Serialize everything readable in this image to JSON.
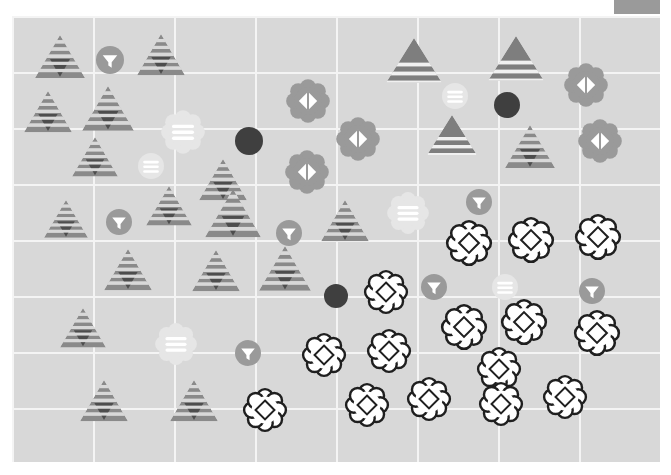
{
  "app": {
    "title": "Scatter Plot Canvas",
    "background_color": "#ffffff"
  },
  "corner_tab": {
    "name": "legend-swatch",
    "color": "#9a9a9a",
    "x": 614,
    "y": 0,
    "width": 46,
    "height": 14
  },
  "canvas": {
    "x": 12,
    "y": 16,
    "width": 648,
    "height": 446,
    "background_color": "#d8d8d8",
    "grid": {
      "visible": true,
      "color": "#f4f4f4",
      "vertical_x": [
        12,
        93,
        174,
        255,
        336,
        417,
        498,
        579,
        660
      ],
      "horizontal_y": [
        16,
        72,
        128,
        184,
        240,
        296,
        352,
        408,
        462
      ]
    }
  },
  "palette": {
    "triangle_gray": "#8a8a8a",
    "triangle_dark": "#4d4d4d",
    "triangle_stripe": "#d8d8d8",
    "circle_gray": "#9a9a9a",
    "circle_dark": "#3f3f3f",
    "flower_gray": "#9a9a9a",
    "flower_white_fill": "#ffffff",
    "flower_white_stroke": "#1f1f1f",
    "faded": "#e6e6e6",
    "faded_inner": "#fbfbfb"
  },
  "chart_data": {
    "type": "scatter",
    "title": "",
    "xlabel": "",
    "ylabel": "",
    "xlim": [
      0,
      671
    ],
    "ylim": [
      0,
      475
    ],
    "grid": true,
    "legend": "none",
    "glyph_classes": [
      {
        "id": "striped-triangle",
        "shape": "triangle",
        "fill": "#8a8a8a",
        "pattern": "horizontal-stripes",
        "inner": "down-triangle-dark"
      },
      {
        "id": "banded-triangle",
        "shape": "triangle",
        "fill": "#8a8a8a",
        "pattern": "wide-bands",
        "inner": "none"
      },
      {
        "id": "funnel-circle",
        "shape": "circle",
        "fill": "#9a9a9a",
        "inner": "white-funnel"
      },
      {
        "id": "solid-dark-circle",
        "shape": "circle",
        "fill": "#3f3f3f",
        "inner": "none"
      },
      {
        "id": "faded-striped-circle",
        "shape": "circle",
        "fill": "#e6e6e6",
        "inner": "white-stripes"
      },
      {
        "id": "gray-flower-diamond",
        "shape": "flower",
        "fill": "#9a9a9a",
        "inner": "white-diamond-split"
      },
      {
        "id": "white-flower-diamond",
        "shape": "flower",
        "fill": "#ffffff",
        "stroke": "#1f1f1f",
        "inner": "diamond-outline"
      },
      {
        "id": "faded-flower-stripes",
        "shape": "flower",
        "fill": "#e6e6e6",
        "inner": "white-stripes"
      }
    ],
    "points": [
      {
        "glyph": "striped-triangle",
        "x": 60,
        "y": 60,
        "size": 50
      },
      {
        "glyph": "funnel-circle",
        "x": 110,
        "y": 60,
        "size": 28
      },
      {
        "glyph": "striped-triangle",
        "x": 161,
        "y": 58,
        "size": 48
      },
      {
        "glyph": "banded-triangle",
        "x": 414,
        "y": 66,
        "size": 56
      },
      {
        "glyph": "banded-triangle",
        "x": 516,
        "y": 64,
        "size": 56
      },
      {
        "glyph": "gray-flower-diamond",
        "x": 586,
        "y": 85,
        "size": 46
      },
      {
        "glyph": "striped-triangle",
        "x": 48,
        "y": 115,
        "size": 48
      },
      {
        "glyph": "striped-triangle",
        "x": 108,
        "y": 112,
        "size": 52
      },
      {
        "glyph": "faded-flower-stripes",
        "x": 183,
        "y": 132,
        "size": 46
      },
      {
        "glyph": "solid-dark-circle",
        "x": 249,
        "y": 141,
        "size": 28
      },
      {
        "glyph": "gray-flower-diamond",
        "x": 308,
        "y": 101,
        "size": 46
      },
      {
        "glyph": "gray-flower-diamond",
        "x": 358,
        "y": 139,
        "size": 46
      },
      {
        "glyph": "faded-striped-circle",
        "x": 455,
        "y": 96,
        "size": 26
      },
      {
        "glyph": "solid-dark-circle",
        "x": 507,
        "y": 105,
        "size": 26
      },
      {
        "glyph": "banded-triangle",
        "x": 452,
        "y": 140,
        "size": 50
      },
      {
        "glyph": "striped-triangle",
        "x": 530,
        "y": 150,
        "size": 50
      },
      {
        "glyph": "gray-flower-diamond",
        "x": 600,
        "y": 141,
        "size": 46
      },
      {
        "glyph": "striped-triangle",
        "x": 95,
        "y": 160,
        "size": 46
      },
      {
        "glyph": "faded-striped-circle",
        "x": 151,
        "y": 166,
        "size": 26
      },
      {
        "glyph": "striped-triangle",
        "x": 223,
        "y": 183,
        "size": 48
      },
      {
        "glyph": "gray-flower-diamond",
        "x": 307,
        "y": 172,
        "size": 46
      },
      {
        "glyph": "striped-triangle",
        "x": 66,
        "y": 222,
        "size": 44
      },
      {
        "glyph": "funnel-circle",
        "x": 119,
        "y": 222,
        "size": 26
      },
      {
        "glyph": "striped-triangle",
        "x": 169,
        "y": 209,
        "size": 46
      },
      {
        "glyph": "striped-triangle",
        "x": 233,
        "y": 217,
        "size": 56
      },
      {
        "glyph": "funnel-circle",
        "x": 289,
        "y": 233,
        "size": 26
      },
      {
        "glyph": "striped-triangle",
        "x": 345,
        "y": 224,
        "size": 48
      },
      {
        "glyph": "faded-flower-stripes",
        "x": 408,
        "y": 213,
        "size": 44
      },
      {
        "glyph": "funnel-circle",
        "x": 479,
        "y": 202,
        "size": 26
      },
      {
        "glyph": "white-flower-diamond",
        "x": 469,
        "y": 243,
        "size": 46
      },
      {
        "glyph": "white-flower-diamond",
        "x": 531,
        "y": 240,
        "size": 46
      },
      {
        "glyph": "white-flower-diamond",
        "x": 598,
        "y": 237,
        "size": 46
      },
      {
        "glyph": "striped-triangle",
        "x": 128,
        "y": 273,
        "size": 48
      },
      {
        "glyph": "striped-triangle",
        "x": 216,
        "y": 274,
        "size": 48
      },
      {
        "glyph": "striped-triangle",
        "x": 285,
        "y": 272,
        "size": 52
      },
      {
        "glyph": "solid-dark-circle",
        "x": 336,
        "y": 296,
        "size": 24
      },
      {
        "glyph": "white-flower-diamond",
        "x": 386,
        "y": 292,
        "size": 44
      },
      {
        "glyph": "funnel-circle",
        "x": 434,
        "y": 287,
        "size": 26
      },
      {
        "glyph": "faded-striped-circle",
        "x": 505,
        "y": 287,
        "size": 26
      },
      {
        "glyph": "white-flower-diamond",
        "x": 464,
        "y": 327,
        "size": 46
      },
      {
        "glyph": "white-flower-diamond",
        "x": 524,
        "y": 322,
        "size": 46
      },
      {
        "glyph": "funnel-circle",
        "x": 592,
        "y": 291,
        "size": 26
      },
      {
        "glyph": "white-flower-diamond",
        "x": 597,
        "y": 333,
        "size": 46
      },
      {
        "glyph": "striped-triangle",
        "x": 83,
        "y": 331,
        "size": 46
      },
      {
        "glyph": "faded-flower-stripes",
        "x": 176,
        "y": 344,
        "size": 44
      },
      {
        "glyph": "funnel-circle",
        "x": 248,
        "y": 353,
        "size": 26
      },
      {
        "glyph": "white-flower-diamond",
        "x": 324,
        "y": 355,
        "size": 44
      },
      {
        "glyph": "white-flower-diamond",
        "x": 389,
        "y": 351,
        "size": 44
      },
      {
        "glyph": "white-flower-diamond",
        "x": 499,
        "y": 369,
        "size": 44
      },
      {
        "glyph": "striped-triangle",
        "x": 104,
        "y": 404,
        "size": 48
      },
      {
        "glyph": "striped-triangle",
        "x": 194,
        "y": 404,
        "size": 48
      },
      {
        "glyph": "white-flower-diamond",
        "x": 265,
        "y": 410,
        "size": 44
      },
      {
        "glyph": "white-flower-diamond",
        "x": 367,
        "y": 405,
        "size": 44
      },
      {
        "glyph": "white-flower-diamond",
        "x": 429,
        "y": 399,
        "size": 44
      },
      {
        "glyph": "white-flower-diamond",
        "x": 501,
        "y": 404,
        "size": 44
      },
      {
        "glyph": "white-flower-diamond",
        "x": 565,
        "y": 397,
        "size": 44
      }
    ]
  }
}
